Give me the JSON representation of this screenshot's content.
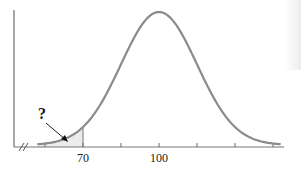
{
  "chart_data": {
    "type": "area",
    "title": "",
    "subtitle": "",
    "xlabel": "",
    "ylabel": "",
    "distribution": "normal",
    "mean": 100,
    "sd": 15,
    "x_ticks": [
      55,
      70,
      85,
      100,
      115,
      130,
      145
    ],
    "x_tick_labels": [
      {
        "value": 70,
        "label": "70"
      },
      {
        "value": 100,
        "label": "100"
      }
    ],
    "shaded_region": {
      "from": 55,
      "to": 70,
      "annotation": "?"
    },
    "axis_break": true,
    "grid": false,
    "legend": null
  },
  "labels": {
    "tick_70": "70",
    "tick_100": "100",
    "question": "?"
  },
  "colors": {
    "curve": "#8a8a8a",
    "axis": "#777777",
    "shade": "#ececec",
    "text": "#222222"
  }
}
